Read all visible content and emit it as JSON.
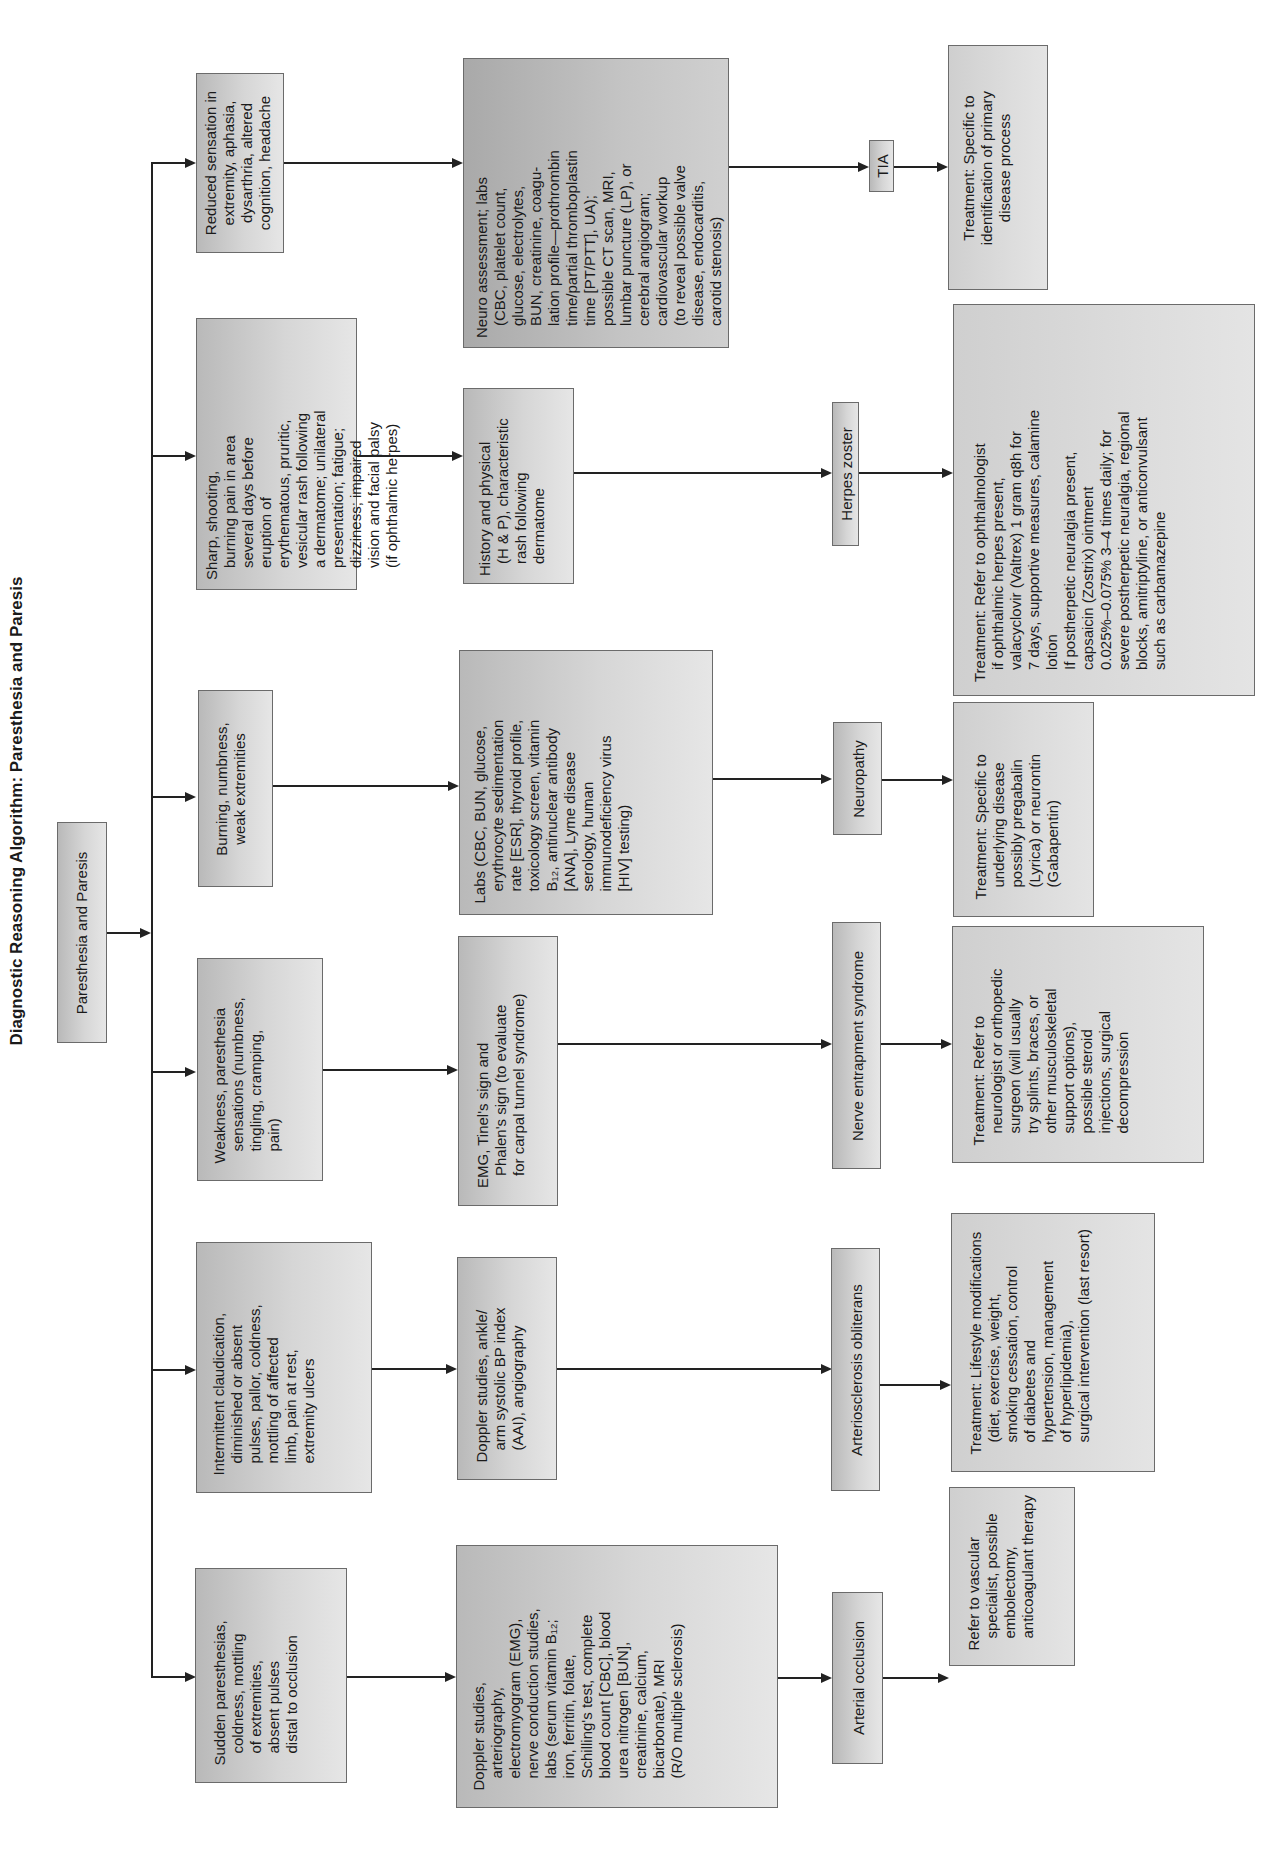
{
  "title": "Diagnostic Reasoning Algorithm: Paresthesia and Paresis",
  "root": "Paresthesia and Paresis",
  "columns": [
    {
      "symptom": "Reduced sensation in\nextremity, aphasia,\ndysarthria, altered\ncognition, headache",
      "test": "Neuro assessment; labs\n(CBC, platelet count,\nglucose, electrolytes,\nBUN, creatinine, coagu-\nlation profile—prothrombin\ntime/partial thromboplastin\ntime [PT/PTT], UA);\npossible CT scan, MRI,\nlumbar puncture (LP), or\ncerebral angiogram;\ncardiovascular workup\n(to reveal possible valve\ndisease, endocarditis,\ncarotid stenosis)",
      "diagnosis": "TIA",
      "treatment": "Treatment: Specific to\nidentification of primary\ndisease process"
    },
    {
      "symptom": "Sharp, shooting,\nburning pain in area\nseveral days before\neruption of\nerythematous, pruritic,\nvesicular rash following\na dermatome; unilateral\npresentation; fatigue;\ndizziness; impaired\nvision and facial palsy\n(if ophthalmic herpes)",
      "test": "History and physical\n(H & P), characteristic\nrash following\ndermatome",
      "diagnosis": "Herpes zoster",
      "treatment": "Treatment: Refer to ophthalmologist\nif ophthalmic herpes present,\nvalacyclovir (Valtrex) 1 gram q8h for\n7 days, supportive measures, calamine\nlotion\nIf postherpetic neuralgia present,\ncapsaicin (Zostrix) ointment\n0.025%–0.075% 3–4 times daily; for\nsevere postherpetic neuralgia, regional\nblocks, amitriptyline, or anticonvulsant\nsuch as carbamazepine"
    },
    {
      "symptom": "Burning, numbness,\nweak extremities",
      "test": "Labs (CBC, BUN, glucose,\nerythrocyte sedimentation\nrate [ESR], thyroid profile,\ntoxicology screen, vitamin\nB₁₂, antinuclear antibody\n[ANA], Lyme disease\nserology, human\nimmunodeficiency virus\n[HIV] testing)",
      "diagnosis": "Neuropathy",
      "treatment": "Treatment: Specific to\nunderlying disease\npossibly pregabalin\n(Lyrica) or neurontin\n(Gabapentin)"
    },
    {
      "symptom": "Weakness, paresthesia\nsensations (numbness,\ntingling, cramping,\npain)",
      "test": "EMG, Tinel's sign and\nPhalen's sign (to evaluate\nfor carpal tunnel syndrome)",
      "diagnosis": "Nerve entrapment syndrome",
      "treatment": "Treatment: Refer to\nneurologist or orthopedic\nsurgeon (will usually\ntry splints, braces, or\nother musculoskeletal\nsupport options),\npossible steroid\ninjections, surgical\ndecompression"
    },
    {
      "symptom": "Intermittent claudication,\ndiminished or absent\npulses, pallor, coldness,\nmottling of affected\nlimb, pain at rest,\nextremity ulcers",
      "test": "Doppler studies, ankle/\narm systolic BP index\n(AAI), angiography",
      "diagnosis": "Arteriosclerosis obliterans",
      "treatment": "Treatment: Lifestyle modifications\n(diet, exercise, weight,\nsmoking cessation, control\nof diabetes and\nhypertension, management\nof hyperlipidemia),\nsurgical intervention (last resort)"
    },
    {
      "symptom": "Sudden paresthesias,\ncoldness, mottling\nof extremities,\nabsent pulses\ndistal to occlusion",
      "test": "Doppler studies,\narteriography,\nelectromyogram (EMG),\nnerve conduction studies,\nlabs (serum vitamin B₁₂;\niron, ferritin, folate,\nSchilling's test, complete\nblood count [CBC], blood\nurea nitrogen [BUN],\ncreatinine, calcium,\nbicarbonate), MRI\n(R/O multiple sclerosis)",
      "diagnosis": "Arterial occlusion",
      "treatment": "Refer to vascular\nspecialist, possible\nembolectomy,\nanticoagulant therapy"
    }
  ],
  "colors": {
    "box_border": "#6b6b6b",
    "box_fill": "#cfcfcf",
    "line": "#222222",
    "background": "#ffffff"
  }
}
